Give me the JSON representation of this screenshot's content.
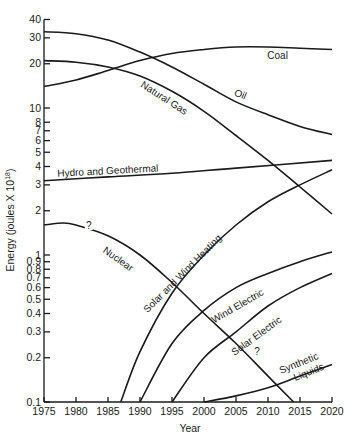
{
  "chart_data": {
    "type": "line",
    "title": "",
    "xlabel": "Year",
    "ylabel": "Energy (joules × 10^18)",
    "ylabel_display": "Energy (joules X 10",
    "ylabel_sup": "18",
    "yscale": "log",
    "xlim": [
      1975,
      2020
    ],
    "ylim": [
      0.1,
      40
    ],
    "grid": false,
    "legend": "inline curve labels",
    "x_ticks": [
      1975,
      1980,
      1985,
      1990,
      1995,
      2000,
      2005,
      2010,
      2015,
      2020
    ],
    "y_ticks": [
      {
        "value": 40,
        "label": "40"
      },
      {
        "value": 30,
        "label": "30"
      },
      {
        "value": 20,
        "label": "20"
      },
      {
        "value": 10,
        "label": "10"
      },
      {
        "value": 8,
        "label": "8"
      },
      {
        "value": 7,
        "label": "7"
      },
      {
        "value": 6,
        "label": "6"
      },
      {
        "value": 5,
        "label": "5"
      },
      {
        "value": 4,
        "label": "4"
      },
      {
        "value": 3,
        "label": "3"
      },
      {
        "value": 2,
        "label": "2"
      },
      {
        "value": 1,
        "label": "1"
      },
      {
        "value": 0.9,
        "label": "0.9"
      },
      {
        "value": 0.8,
        "label": "0.8"
      },
      {
        "value": 0.7,
        "label": "0.7"
      },
      {
        "value": 0.6,
        "label": "0.6"
      },
      {
        "value": 0.5,
        "label": "0.5"
      },
      {
        "value": 0.4,
        "label": "0.4"
      },
      {
        "value": 0.3,
        "label": "0.3"
      },
      {
        "value": 0.2,
        "label": "0.2"
      },
      {
        "value": 0.1,
        "label": "0.1"
      }
    ],
    "series": [
      {
        "name": "Coal",
        "x": [
          1975,
          1980,
          1985,
          1990,
          1995,
          2000,
          2005,
          2010,
          2015,
          2020
        ],
        "values": [
          14,
          15.5,
          18,
          21,
          23.5,
          25,
          26,
          26,
          25.5,
          25
        ],
        "label": {
          "text": "Coal",
          "year": 2011.5,
          "value": 21.5,
          "angle": 0
        }
      },
      {
        "name": "Oil",
        "x": [
          1975,
          1980,
          1985,
          1990,
          1995,
          2000,
          2005,
          2010,
          2015,
          2020
        ],
        "values": [
          33,
          32,
          29,
          24,
          19,
          14.5,
          11,
          9,
          7.5,
          6.6
        ],
        "label": {
          "text": "Oil",
          "year": 2005.5,
          "value": 11.8,
          "angle": 22
        }
      },
      {
        "name": "Natural Gas",
        "x": [
          1975,
          1980,
          1985,
          1990,
          1995,
          2000,
          2005,
          2010,
          2015,
          2020
        ],
        "values": [
          21,
          20.5,
          19,
          16.5,
          13,
          9.5,
          6.5,
          4.4,
          2.9,
          1.9
        ],
        "label": {
          "text": "Natural Gas",
          "year": 1993.5,
          "value": 11.2,
          "angle": 33
        }
      },
      {
        "name": "Hydro and Geothermal",
        "x": [
          1975,
          1985,
          1995,
          2005,
          2020
        ],
        "values": [
          3.2,
          3.4,
          3.6,
          3.9,
          4.4
        ],
        "label": {
          "text": "Hydro and Geothermal",
          "year": 1985,
          "value": 3.55,
          "angle": -3
        }
      },
      {
        "name": "Nuclear",
        "x": [
          1975,
          1978,
          1980,
          1985,
          1990,
          1995,
          2000,
          2005,
          2010,
          2014
        ],
        "values": [
          1.6,
          1.65,
          1.6,
          1.35,
          1.0,
          0.65,
          0.4,
          0.25,
          0.15,
          0.1
        ],
        "question_marks": [
          {
            "year": 1982,
            "value": 1.55
          },
          {
            "year": 2008.3,
            "value": 0.215
          }
        ],
        "label": {
          "text": "Nuclear",
          "year": 1986.3,
          "value": 0.9,
          "angle": 35
        }
      },
      {
        "name": "Solar and Wind Heating",
        "x": [
          1987,
          1990,
          1995,
          2000,
          2005,
          2010,
          2015,
          2020
        ],
        "values": [
          0.1,
          0.22,
          0.55,
          1.0,
          1.6,
          2.3,
          3.0,
          3.8
        ],
        "label": {
          "text": "Solar and Wind Heating",
          "year": 1997,
          "value": 0.72,
          "angle": -45
        }
      },
      {
        "name": "Wind Electric",
        "x": [
          1990,
          1995,
          2000,
          2005,
          2010,
          2015,
          2020
        ],
        "values": [
          0.1,
          0.25,
          0.42,
          0.6,
          0.75,
          0.9,
          1.05
        ],
        "label": {
          "text": "Wind Electric",
          "year": 2005.5,
          "value": 0.43,
          "angle": -30
        }
      },
      {
        "name": "Solar Electric",
        "x": [
          1995,
          2000,
          2005,
          2010,
          2015,
          2020
        ],
        "values": [
          0.1,
          0.2,
          0.3,
          0.45,
          0.6,
          0.75
        ],
        "label": {
          "text": "Solar Electric",
          "year": 2008.5,
          "value": 0.27,
          "angle": -36
        }
      },
      {
        "name": "Synthetic Liquids",
        "x": [
          2000,
          2005,
          2010,
          2015,
          2020
        ],
        "values": [
          0.1,
          0.11,
          0.125,
          0.15,
          0.18
        ],
        "label": {
          "text": "Synthetic",
          "text2": "Liquids",
          "year": 2015,
          "value": 0.175,
          "angle": -22
        }
      }
    ]
  }
}
